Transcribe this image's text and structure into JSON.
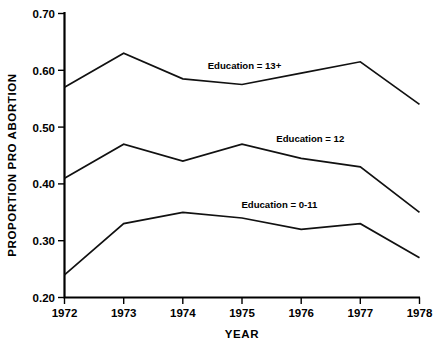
{
  "chart_data": {
    "type": "line",
    "title": "",
    "xlabel": "YEAR",
    "ylabel": "PROPORTION PRO ABORTION",
    "categories": [
      "1972",
      "1973",
      "1974",
      "1975",
      "1976",
      "1977",
      "1978"
    ],
    "x": [
      1972,
      1973,
      1974,
      1975,
      1976,
      1977,
      1978
    ],
    "xlim": [
      1972,
      1978
    ],
    "ylim": [
      0.2,
      0.7
    ],
    "ytick_values": [
      0.2,
      0.3,
      0.4,
      0.5,
      0.6,
      0.7
    ],
    "ytick_labels": [
      "0.20",
      "0.30",
      "0.40",
      "0.50",
      "0.60",
      "0.70"
    ],
    "grid": false,
    "legend_position": "inline-annotations",
    "series": [
      {
        "name": "Education = 13+",
        "label": "Education = 13+",
        "values": [
          0.57,
          0.63,
          0.585,
          0.575,
          0.595,
          0.615,
          0.54
        ]
      },
      {
        "name": "Education = 12",
        "label": "Education = 12",
        "values": [
          0.41,
          0.47,
          0.44,
          0.47,
          0.445,
          0.43,
          0.35
        ]
      },
      {
        "name": "Education = 0-11",
        "label": "Education = 0-11",
        "values": [
          0.24,
          0.33,
          0.35,
          0.34,
          0.32,
          0.33,
          0.27
        ]
      }
    ],
    "annotations": [
      {
        "text": "Education = 13+",
        "x": 1974.42,
        "y": 0.602
      },
      {
        "text": "Education = 12",
        "x": 1975.58,
        "y": 0.473
      },
      {
        "text": "Education = 0-11",
        "x": 1974.99,
        "y": 0.358
      }
    ],
    "colors": {
      "line": "#111111",
      "axis": "#000000",
      "background": "#ffffff",
      "text": "#000000"
    }
  }
}
